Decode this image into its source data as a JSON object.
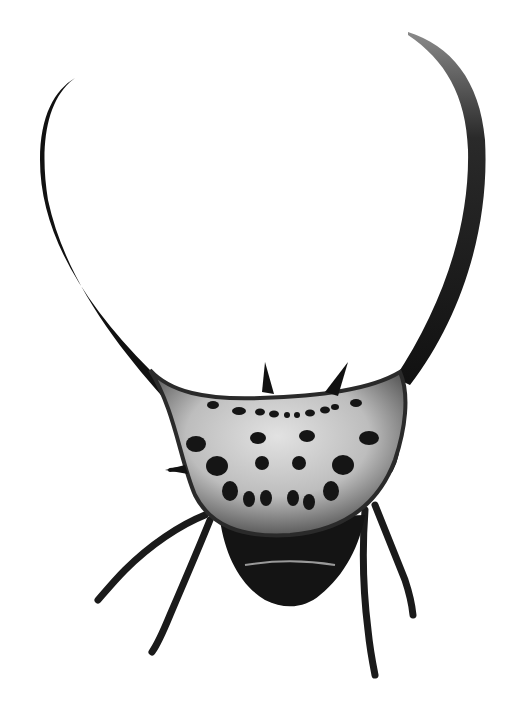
{
  "image": {
    "subject": "long-horned orb weaver spider",
    "style": "black-and-white photograph",
    "background": "#ffffff",
    "colors": {
      "dark": "#111111",
      "mid": "#6e6e6e",
      "light": "#d4d4d4",
      "spots": "#151515"
    }
  }
}
